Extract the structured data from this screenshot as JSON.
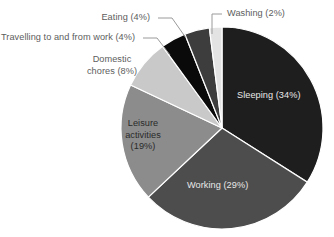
{
  "chart_data": {
    "type": "pie",
    "title": "",
    "subtitle": "",
    "xlabel": "",
    "ylabel": "",
    "legend_position": "none",
    "grid": false,
    "unit": "%",
    "start_angle_deg": 0,
    "direction": "clockwise",
    "categories": [
      "Sleeping",
      "Working",
      "Leisure activities",
      "Domestic chores",
      "Travelling to and from work",
      "Eating",
      "Washing"
    ],
    "values": [
      34,
      29,
      19,
      8,
      4,
      4,
      2
    ],
    "colors": [
      "#1e1e1e",
      "#4d4d4d",
      "#8c8c8c",
      "#c9c9c9",
      "#0a0a0a",
      "#3d3d3d",
      "#e3e3e3"
    ],
    "slices": [
      {
        "label": "Sleeping",
        "value": 34,
        "text": "Sleeping (34%)",
        "color": "#1e1e1e",
        "label_placement": "inside",
        "label_color": "#e8e8e8"
      },
      {
        "label": "Working",
        "value": 29,
        "text": "Working (29%)",
        "color": "#4d4d4d",
        "label_placement": "inside",
        "label_color": "#e8e8e8"
      },
      {
        "label": "Leisure activities",
        "value": 19,
        "text_line1": "Leisure",
        "text_line2": "activities",
        "text_line3": "(19%)",
        "text": "Leisure activities (19%)",
        "color": "#8c8c8c",
        "label_placement": "inside",
        "label_color": "#2a2a2a"
      },
      {
        "label": "Domestic chores",
        "value": 8,
        "text_line1": "Domestic",
        "text_line2": "chores (8%)",
        "text": "Domestic chores (8%)",
        "color": "#c9c9c9",
        "label_placement": "outside",
        "label_color": "#5d5d5d"
      },
      {
        "label": "Travelling to and from work",
        "value": 4,
        "text": "Travelling to and from work (4%)",
        "color": "#0a0a0a",
        "label_placement": "outside",
        "label_color": "#5d5d5d"
      },
      {
        "label": "Eating",
        "value": 4,
        "text": "Eating (4%)",
        "color": "#3d3d3d",
        "label_placement": "outside",
        "label_color": "#5d5d5d"
      },
      {
        "label": "Washing",
        "value": 2,
        "text": "Washing (2%)",
        "color": "#e3e3e3",
        "label_placement": "outside",
        "label_color": "#5d5d5d"
      }
    ]
  },
  "style": {
    "background": "#ffffff",
    "leader_line_color": "#9a9a9a",
    "slice_separator_color": "#ffffff",
    "label_text_color": "#5d5d5d"
  }
}
